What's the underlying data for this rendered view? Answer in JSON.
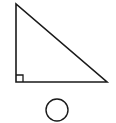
{
  "diagram": {
    "background": "#ffffff",
    "stroke_color": "#1a1a1a",
    "shapes": [
      {
        "type": "right-triangle",
        "vertices": [
          [
            16,
            4
          ],
          [
            16,
            82
          ],
          [
            107,
            82
          ]
        ],
        "right_angle_vertex": [
          16,
          82
        ],
        "right_angle_marker_size": 7
      },
      {
        "type": "circle",
        "center": [
          57,
          110
        ],
        "radius": 11
      }
    ]
  }
}
